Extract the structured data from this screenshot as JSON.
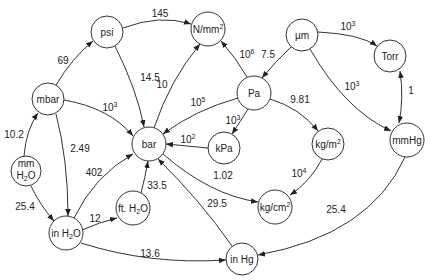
{
  "diagram": {
    "type": "unit-conversion-graph",
    "nodes": [
      {
        "id": "psi",
        "label": "psi",
        "x": 107,
        "y": 32
      },
      {
        "id": "nmm2",
        "label": "N/mm",
        "sup": "2",
        "x": 208,
        "y": 29
      },
      {
        "id": "um",
        "label": "µm",
        "x": 302,
        "y": 35
      },
      {
        "id": "torr",
        "label": "Torr",
        "x": 390,
        "y": 56
      },
      {
        "id": "mbar",
        "label": "mbar",
        "x": 48,
        "y": 99
      },
      {
        "id": "pa",
        "label": "Pa",
        "x": 254,
        "y": 93
      },
      {
        "id": "bar",
        "label": "bar",
        "x": 149,
        "y": 144
      },
      {
        "id": "kpa",
        "label": "kPa",
        "x": 224,
        "y": 148
      },
      {
        "id": "kgm2",
        "label": "kg/m",
        "sup": "2",
        "x": 328,
        "y": 144
      },
      {
        "id": "mmhg",
        "label": "mmHg",
        "x": 407,
        "y": 140
      },
      {
        "id": "mmh2o",
        "label": "mm",
        "label2": "H2O",
        "x": 26,
        "y": 171
      },
      {
        "id": "fth2o",
        "label": "ft. H2O",
        "x": 133,
        "y": 208
      },
      {
        "id": "kgcm2",
        "label": "kg/cm",
        "sup": "2",
        "x": 275,
        "y": 207
      },
      {
        "id": "inh2o",
        "label": "in H2O",
        "x": 66,
        "y": 233
      },
      {
        "id": "inhg",
        "label": "in Hg",
        "x": 242,
        "y": 259
      }
    ],
    "edges": [
      {
        "from": "psi",
        "to": "nmm2",
        "label": "145"
      },
      {
        "from": "mbar",
        "to": "psi",
        "label": "69"
      },
      {
        "from": "psi",
        "to": "bar",
        "label": "14.5"
      },
      {
        "from": "bar",
        "to": "nmm2",
        "label": "10"
      },
      {
        "from": "pa",
        "to": "nmm2",
        "label": "10",
        "sup": "6"
      },
      {
        "from": "um",
        "to": "pa",
        "label": "7.5"
      },
      {
        "from": "um",
        "to": "torr",
        "label": "10",
        "sup": "3"
      },
      {
        "from": "um",
        "to": "mmhg",
        "label": "10",
        "sup": "3"
      },
      {
        "from": "torr",
        "to": "mmhg",
        "label": "1",
        "bidirectional": true
      },
      {
        "from": "mbar",
        "to": "bar",
        "label": "10",
        "sup": "3"
      },
      {
        "from": "pa",
        "to": "bar",
        "label": "10",
        "sup": "5"
      },
      {
        "from": "pa",
        "to": "kpa",
        "label": "10",
        "sup": "3"
      },
      {
        "from": "kpa",
        "to": "bar",
        "label": "10",
        "sup": "2"
      },
      {
        "from": "pa",
        "to": "kgm2",
        "label": "9.81"
      },
      {
        "from": "kgm2",
        "to": "kgcm2",
        "label": "10",
        "sup": "4"
      },
      {
        "from": "bar",
        "to": "kgcm2",
        "label": "1.02"
      },
      {
        "from": "mmh2o",
        "to": "mbar",
        "label": "10.2"
      },
      {
        "from": "mbar",
        "to": "inh2o",
        "label": "2.49"
      },
      {
        "from": "mmh2o",
        "to": "inh2o",
        "label": "25.4"
      },
      {
        "from": "inh2o",
        "to": "bar",
        "label": "402"
      },
      {
        "from": "inh2o",
        "to": "fth2o",
        "label": "12"
      },
      {
        "from": "fth2o",
        "to": "bar",
        "label": "33.5"
      },
      {
        "from": "inhg",
        "to": "bar",
        "label": "29.5"
      },
      {
        "from": "inh2o",
        "to": "inhg",
        "label": "13.6"
      },
      {
        "from": "mmhg",
        "to": "inhg",
        "label": "25.4"
      }
    ]
  }
}
